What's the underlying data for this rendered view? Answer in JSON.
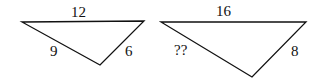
{
  "diagram": {
    "triangles": [
      {
        "id": "small",
        "vertices": [
          [
            22,
            22
          ],
          [
            144,
            21
          ],
          [
            100,
            65
          ]
        ],
        "labels": {
          "top": "12",
          "left": "9",
          "right": "6"
        }
      },
      {
        "id": "large",
        "vertices": [
          [
            161,
            22
          ],
          [
            306,
            22
          ],
          [
            252,
            77
          ]
        ],
        "labels": {
          "top": "16",
          "left": "??",
          "right": "8"
        }
      }
    ],
    "stroke_color": "#111111"
  }
}
